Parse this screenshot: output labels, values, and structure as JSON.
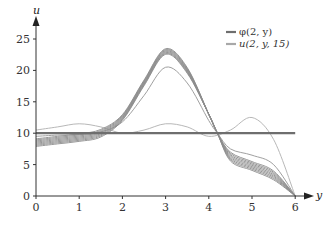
{
  "chart_data": {
    "type": "line",
    "title": "",
    "xlabel": "y",
    "ylabel": "u",
    "xlim": [
      0,
      6.3
    ],
    "ylim": [
      0,
      27
    ],
    "grid": false,
    "legend_position": "top-right",
    "x_ticks": [
      "0",
      "1",
      "2",
      "3",
      "4",
      "5",
      "6"
    ],
    "y_ticks": [
      "0",
      "5",
      "10",
      "15",
      "20",
      "25"
    ],
    "legend": [
      "φ(2, y)",
      "u(2, y, 15)"
    ],
    "series": [
      {
        "name": "φ(2, y)",
        "style": "thick dark gray constant",
        "x": [
          0,
          6
        ],
        "y": [
          10,
          10
        ]
      },
      {
        "name": "u(2, y, 15) [lightest, oscillatory]",
        "x": [
          0,
          0.5,
          1,
          1.5,
          2,
          2.5,
          3,
          3.5,
          4,
          4.5,
          5,
          5.5,
          6
        ],
        "y": [
          10.5,
          11,
          11.5,
          11,
          10,
          10.5,
          11.5,
          11,
          9.5,
          10.5,
          12.5,
          9,
          0
        ]
      },
      {
        "name": "u(2, y, 15) [intermediate]",
        "x": [
          0,
          0.5,
          1,
          1.5,
          2,
          2.5,
          3,
          3.5,
          4,
          4.2,
          4.5,
          5,
          5.5,
          6
        ],
        "y": [
          9.5,
          9.7,
          9.8,
          10.2,
          11.8,
          16,
          20.5,
          18,
          12,
          10,
          7.5,
          6.5,
          5,
          0
        ]
      },
      {
        "name": "u(2, y, 15) [converged band]",
        "x": [
          0,
          0.5,
          1,
          1.5,
          2,
          2.5,
          3,
          3.5,
          4,
          4.2,
          4.5,
          5,
          5.5,
          6
        ],
        "y": [
          8.8,
          9.2,
          9.6,
          10.3,
          12.5,
          18,
          23,
          20,
          13,
          10,
          6,
          4.5,
          3,
          0
        ]
      }
    ]
  },
  "legend": {
    "items": [
      {
        "label": "φ(2, y)",
        "color": "#6e6e6e"
      },
      {
        "label": "u(2, y, 15)",
        "color": "#a8a8a8"
      }
    ]
  },
  "axes": {
    "x_label": "y",
    "y_label": "u",
    "x_ticks": [
      "0",
      "1",
      "2",
      "3",
      "4",
      "5",
      "6"
    ],
    "y_ticks": [
      "0",
      "5",
      "10",
      "15",
      "20",
      "25"
    ]
  },
  "colors": {
    "phi": "#6e6e6e",
    "u_light": "#b8b8b8",
    "u_mid": "#a0a0a0",
    "u_band": "#8c8c8c",
    "axis": "#333333"
  }
}
